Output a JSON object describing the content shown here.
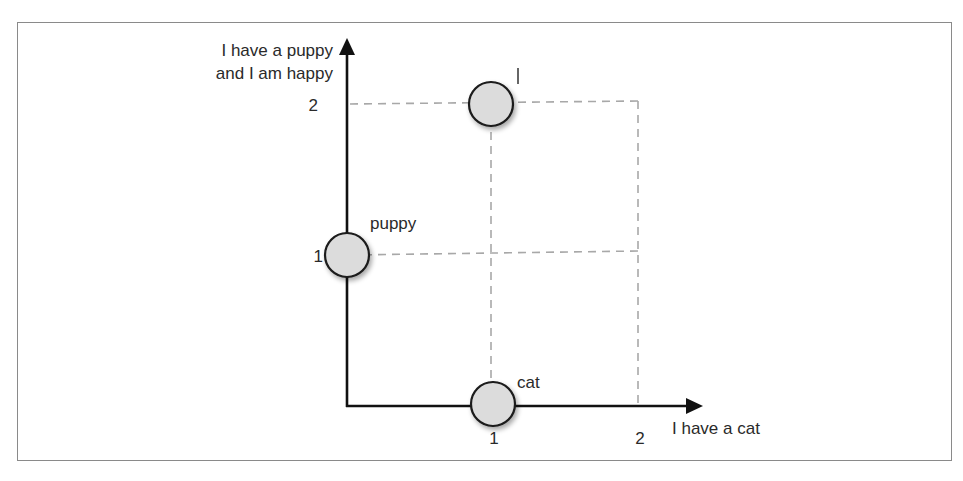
{
  "diagram": {
    "y_axis": {
      "label_line1": "I have a puppy",
      "label_line2": "and I am happy",
      "tick_1": "1",
      "tick_2": "2"
    },
    "x_axis": {
      "label": "I have a cat",
      "tick_1": "1",
      "tick_2": "2"
    },
    "points": [
      {
        "name": "I",
        "x": 1,
        "y": 2
      },
      {
        "name": "puppy",
        "x": 0,
        "y": 1
      },
      {
        "name": "cat",
        "x": 1,
        "y": 0
      }
    ],
    "colors": {
      "axis": "#111111",
      "dash": "#a8a8a8",
      "node_fill": "#dcdcdc",
      "node_stroke": "#1a1a1a",
      "frame": "#8a8a8a"
    }
  }
}
